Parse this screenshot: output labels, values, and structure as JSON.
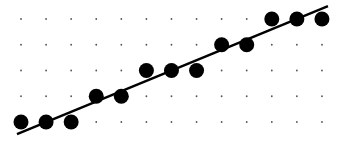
{
  "chart_data": {
    "type": "scatter",
    "title": "",
    "xlabel": "",
    "ylabel": "",
    "grid": "dotted",
    "x": [
      0,
      1,
      2,
      3,
      4,
      5,
      6,
      7,
      8,
      9,
      10,
      11,
      12
    ],
    "y": [
      0,
      0,
      0,
      1,
      1,
      2,
      2,
      2,
      3,
      3,
      4,
      4,
      4
    ],
    "xlim": [
      0,
      12
    ],
    "ylim": [
      0,
      4
    ],
    "trendline": {
      "x0": -0.16,
      "y0": -0.47,
      "x1": 12.24,
      "y1": 4.5
    },
    "colors": {
      "point": "#000000",
      "line": "#000000",
      "grid": "#555555",
      "background": "#ffffff"
    }
  },
  "layout": {
    "origin_px": [
      21,
      122
    ],
    "dx_px": 25.08,
    "dy_px": 25.75,
    "point_radius": 7.5
  }
}
